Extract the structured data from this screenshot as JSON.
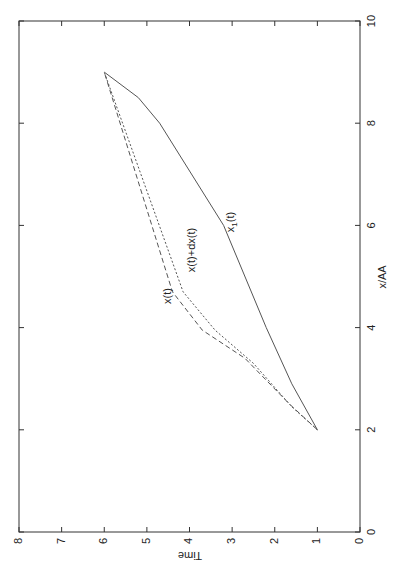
{
  "chart_data": {
    "type": "line",
    "orientation": "rotated-90-ccw",
    "title": "",
    "xlabel": "Time",
    "ylabel": "x/AA",
    "xlim": [
      0,
      8
    ],
    "ylim": [
      0,
      10
    ],
    "xticks": [
      "0",
      "1",
      "2",
      "3",
      "4",
      "5",
      "6",
      "7",
      "8"
    ],
    "yticks": [
      "0",
      "2",
      "4",
      "6",
      "8",
      "10"
    ],
    "grid": false,
    "legend": "inline-labels",
    "series": [
      {
        "name": "x1(t)",
        "label_main": "x",
        "label_sub": "1",
        "label_tail": "(t)",
        "style": "solid",
        "points": [
          [
            1,
            2
          ],
          [
            1.6,
            2.9
          ],
          [
            2.2,
            4
          ],
          [
            3.2,
            6
          ],
          [
            4.7,
            8
          ],
          [
            5.2,
            8.5
          ],
          [
            6,
            9
          ]
        ]
      },
      {
        "name": "x(t)",
        "style": "dashed",
        "points": [
          [
            1,
            2
          ],
          [
            1.65,
            2.5
          ],
          [
            2.7,
            3.4
          ],
          [
            3.7,
            3.95
          ],
          [
            4.4,
            4.7
          ],
          [
            6,
            9
          ]
        ]
      },
      {
        "name": "x(t)+dx(t)",
        "style": "dotted",
        "points": [
          [
            1,
            2
          ],
          [
            1.6,
            2.45
          ],
          [
            2.5,
            3.3
          ],
          [
            3.4,
            3.95
          ],
          [
            4.15,
            4.7
          ],
          [
            6,
            9
          ]
        ]
      }
    ]
  }
}
